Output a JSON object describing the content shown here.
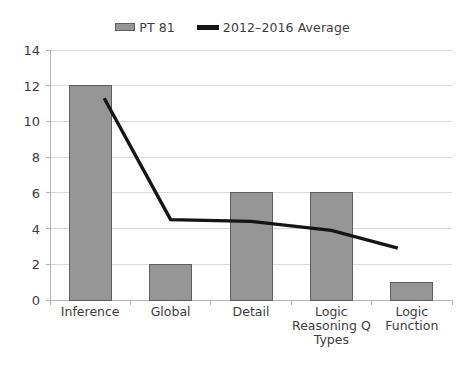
{
  "chart_data": {
    "type": "bar",
    "title": "",
    "subtitle": "",
    "xlabel": "",
    "ylabel": "",
    "ylim": [
      0,
      14
    ],
    "ytick_step": 2,
    "yticks": [
      0,
      2,
      4,
      6,
      8,
      10,
      12,
      14
    ],
    "grid": "horizontal",
    "legend_position": "top-center",
    "categories": [
      "Inference",
      "Global",
      "Detail",
      "Logic Reasoning Q Types",
      "Logic Function"
    ],
    "category_lines": [
      [
        "Inference"
      ],
      [
        "Global"
      ],
      [
        "Detail"
      ],
      [
        "Logic",
        "Reasoning Q",
        "Types"
      ],
      [
        "Logic",
        "Function"
      ]
    ],
    "series": [
      {
        "name": "PT 81",
        "type": "bar",
        "color": "#969696",
        "border_color": "#5e5e5e",
        "values": [
          12,
          2,
          6,
          6,
          1
        ]
      },
      {
        "name": "2012–2016 Average",
        "type": "line",
        "color": "#151515",
        "values": [
          11.3,
          4.5,
          4.4,
          3.9,
          2.9
        ]
      }
    ]
  },
  "legend": {
    "entries": [
      {
        "label": "PT 81",
        "marker": "bar-swatch",
        "color": "#969696"
      },
      {
        "label": "2012–2016 Average",
        "marker": "line-swatch",
        "color": "#151515"
      }
    ]
  },
  "axis": {
    "y_labels": [
      "14",
      "12",
      "10",
      "8",
      "6",
      "4",
      "2",
      "0"
    ]
  },
  "colors": {
    "bar_fill": "#969696",
    "bar_stroke": "#5e5e5e",
    "line": "#151515",
    "gridline": "#d9d9d9",
    "axis": "#b4b4b4",
    "text": "#3d3d3d",
    "background": "#ffffff"
  }
}
